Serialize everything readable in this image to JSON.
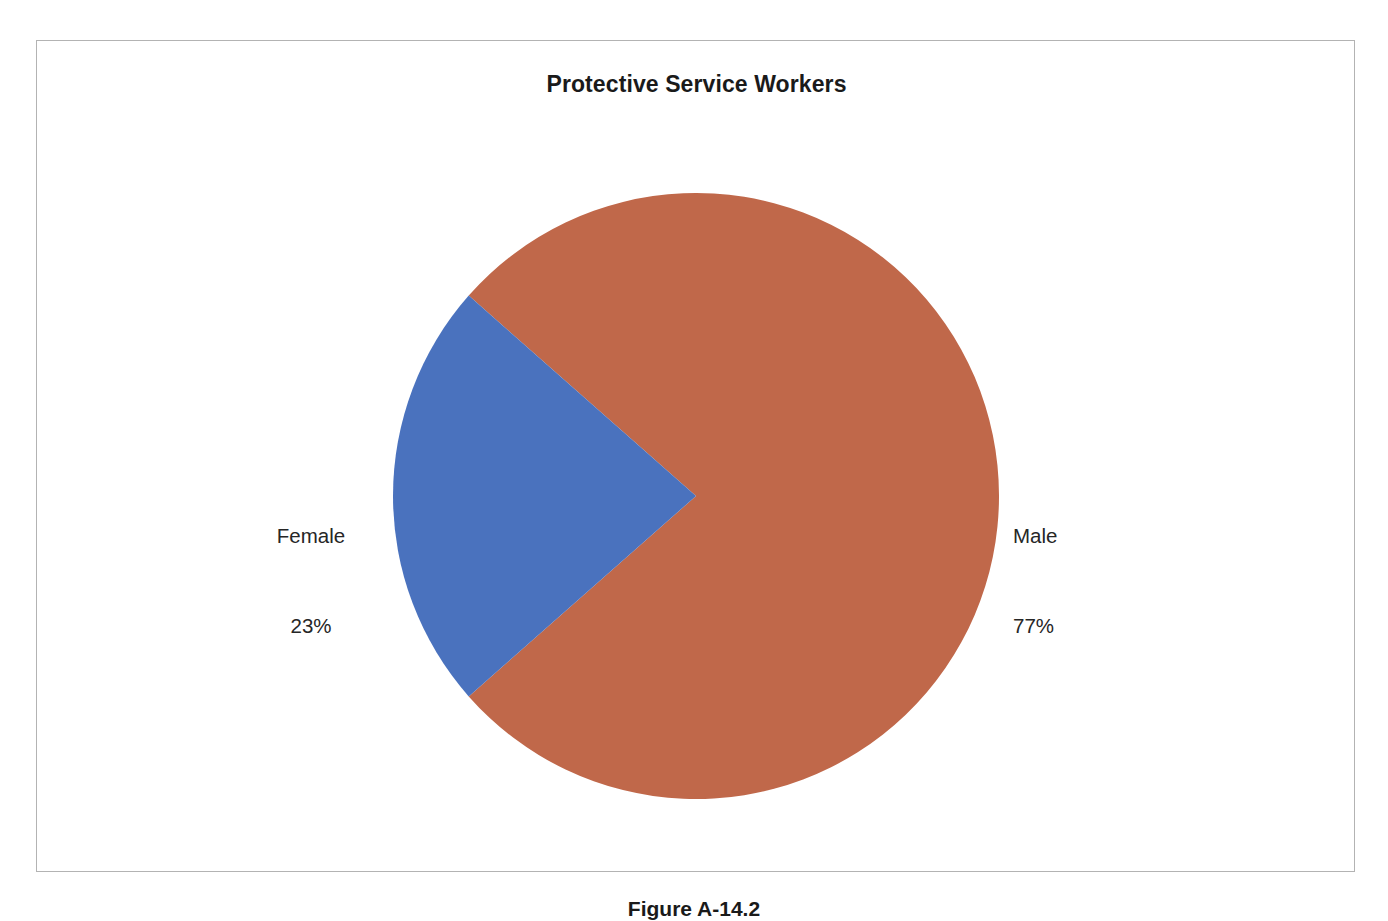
{
  "figure": {
    "caption": "Figure A-14.2"
  },
  "chart_data": {
    "type": "pie",
    "title": "Protective Service Workers",
    "xlabel": "",
    "ylabel": "",
    "legend_position": "none",
    "grid": false,
    "unit": "percent",
    "categories": [
      "Female",
      "Male"
    ],
    "values": [
      23,
      77
    ],
    "colors": [
      "#4a72be",
      "#c0684a"
    ],
    "slices": [
      {
        "label": "Female",
        "value": 23,
        "value_text": "23%",
        "color": "#4a72be",
        "label_side": "left",
        "start_angle_deg": 138.6,
        "end_angle_deg": 221.4
      },
      {
        "label": "Male",
        "value": 77,
        "value_text": "77%",
        "color": "#c0684a",
        "label_side": "right",
        "start_angle_deg": 221.4,
        "end_angle_deg": 498.6
      }
    ],
    "annotations": [
      {
        "name": "female-label",
        "text": "Female",
        "sub_text": "23%"
      },
      {
        "name": "male-label",
        "text": "Male",
        "sub_text": "77%"
      }
    ]
  }
}
